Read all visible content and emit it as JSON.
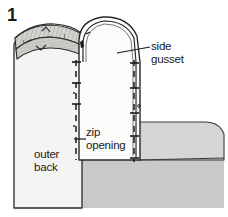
{
  "figure": {
    "step_number": "1",
    "width": 228,
    "height": 217,
    "background_color": "#ffffff",
    "type": "technical-sewing-illustration"
  },
  "labels": {
    "side_gusset": "side\ngusset",
    "zip_opening": "zip\nopening",
    "outer_back": "outer\nback"
  },
  "colors": {
    "outline": "#1a1a1a",
    "outer_back_fill": "#f4f4f2",
    "gusset_fill": "#fbfbfa",
    "dome_fill": "#f0f0ee",
    "side_panel_fill": "#d6d6d6",
    "lower_panel_fill": "#c9c9c9",
    "tape_band_fill": "#d0d0cc",
    "stitch_line": "#1a1a1a",
    "label_text": "#1a1a1a"
  },
  "leader_lines": {
    "side_gusset": {
      "from_x": 117,
      "from_y": 53,
      "to_x": 150,
      "to_y": 47
    },
    "zip_opening": {
      "from_x": 74,
      "from_y": 139,
      "to_x": 86,
      "to_y": 139
    }
  },
  "annotations": {
    "left_seam_stitch": "dashed stitch line with T-bar tack marks along left zip edge",
    "right_seam_stitch": "dashed stitch line with T-bar tack marks along right zip edge",
    "top_tape_band": "hatched zip tape / binding band across top edge with notch marks"
  }
}
